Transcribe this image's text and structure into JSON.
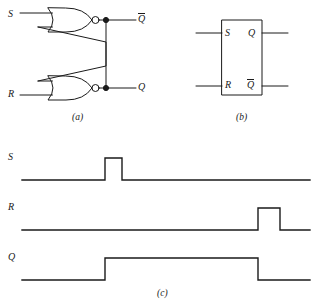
{
  "figure": {
    "stroke_color": "#1a1a1a",
    "background_color": "#ffffff",
    "captions": {
      "a": "(a)",
      "b": "(b)",
      "c": "(c)"
    }
  },
  "circuit_a": {
    "name": "NOR-based SR latch schematic",
    "inputs": [
      {
        "label": "S",
        "x": 10,
        "y": 15
      },
      {
        "label": "R",
        "x": 10,
        "y": 90
      }
    ],
    "outputs": [
      {
        "label": "Q",
        "overbar": true,
        "x": 139,
        "y": 14
      },
      {
        "label": "Q",
        "overbar": false,
        "x": 139,
        "y": 89
      }
    ],
    "gates": [
      {
        "type": "NOR",
        "position": "top"
      },
      {
        "type": "NOR",
        "position": "bottom"
      }
    ],
    "nodes": 2
  },
  "symbol_b": {
    "name": "SR latch block symbol",
    "pins": [
      {
        "label": "S",
        "side": "left",
        "x": 226,
        "y": 34
      },
      {
        "label": "R",
        "side": "left",
        "x": 226,
        "y": 84
      },
      {
        "label": "Q",
        "overbar": false,
        "side": "right",
        "x": 248,
        "y": 34
      },
      {
        "label": "Q",
        "overbar": true,
        "side": "right",
        "x": 248,
        "y": 83
      }
    ]
  },
  "timing_c": {
    "name": "SR latch timing diagram",
    "signals": [
      {
        "label": "S",
        "label_x": 10,
        "label_y": 155,
        "baseline_y": 180,
        "high_y": 158,
        "x_start": 22,
        "x_end": 310,
        "pulses": [
          {
            "rise": 105,
            "fall": 122
          }
        ]
      },
      {
        "label": "R",
        "label_x": 10,
        "label_y": 205,
        "baseline_y": 230,
        "high_y": 208,
        "x_start": 22,
        "x_end": 310,
        "pulses": [
          {
            "rise": 258,
            "fall": 280
          }
        ]
      },
      {
        "label": "Q",
        "label_x": 10,
        "label_y": 255,
        "baseline_y": 280,
        "high_y": 258,
        "x_start": 22,
        "x_end": 310,
        "pulses": [
          {
            "rise": 105,
            "fall": 258
          }
        ]
      }
    ]
  }
}
